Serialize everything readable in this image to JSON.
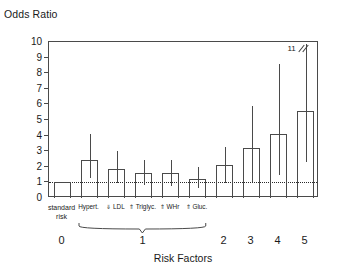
{
  "chart_data": {
    "type": "bar",
    "title": "",
    "ylabel": "Odds Ratio",
    "xlabel": "Risk Factors",
    "ylim": [
      0,
      10
    ],
    "yticks": [
      0,
      1,
      2,
      3,
      4,
      5,
      6,
      7,
      8,
      9,
      10
    ],
    "grid": false,
    "legend": null,
    "reference_line": {
      "value": 1,
      "style": "dotted"
    },
    "group_labels": [
      "0",
      "1",
      "2",
      "3",
      "4",
      "5"
    ],
    "categories": [
      "standard risk",
      "Hypert.",
      "⇓ LDL",
      "⇑ Triglyc.",
      "⇑ WHr",
      "⇑ Gluc.",
      "2",
      "3",
      "4",
      "5"
    ],
    "values": [
      1.0,
      2.45,
      1.85,
      1.6,
      1.6,
      1.25,
      2.1,
      3.2,
      4.1,
      5.6
    ],
    "ci_low": [
      null,
      1.25,
      0.95,
      0.85,
      0.8,
      0.65,
      0.95,
      1.0,
      1.45,
      2.3
    ],
    "ci_high": [
      null,
      4.1,
      3.0,
      2.45,
      2.45,
      2.0,
      3.3,
      5.9,
      8.6,
      11.0
    ],
    "annotations": [
      {
        "text": "11",
        "meaning": "axis-break-upper-ci",
        "series_index": 9
      }
    ]
  },
  "axis": {
    "y_title": "Odds Ratio",
    "x_title": "Risk Factors",
    "y_ticks": [
      "0",
      "1",
      "2",
      "3",
      "4",
      "5",
      "6",
      "7",
      "8",
      "9",
      "10"
    ],
    "x_group_ticks": [
      "0",
      "1",
      "2",
      "3",
      "4",
      "5"
    ]
  },
  "bars": [
    {
      "label_line1": "standard",
      "label_line2": "risk",
      "value": 1.0,
      "low": null,
      "high": null
    },
    {
      "label_line1": "Hypert.",
      "label_line2": "",
      "value": 2.45,
      "low": 1.25,
      "high": 4.1
    },
    {
      "label_line1": "⇓ LDL",
      "label_line2": "",
      "value": 1.85,
      "low": 0.95,
      "high": 3.0
    },
    {
      "label_line1": "⇑ Triglyc.",
      "label_line2": "",
      "value": 1.6,
      "low": 0.85,
      "high": 2.45
    },
    {
      "label_line1": "⇑ WHr",
      "label_line2": "",
      "value": 1.6,
      "low": 0.8,
      "high": 2.45
    },
    {
      "label_line1": "⇑ Gluc.",
      "label_line2": "",
      "value": 1.25,
      "low": 0.65,
      "high": 2.0
    },
    {
      "label_line1": "",
      "label_line2": "",
      "value": 2.1,
      "low": 0.95,
      "high": 3.3
    },
    {
      "label_line1": "",
      "label_line2": "",
      "value": 3.2,
      "low": 1.0,
      "high": 5.9
    },
    {
      "label_line1": "",
      "label_line2": "",
      "value": 4.1,
      "low": 1.45,
      "high": 8.6
    },
    {
      "label_line1": "",
      "label_line2": "",
      "value": 5.6,
      "low": 2.3,
      "high": 11.0
    }
  ],
  "break_annotation": {
    "text": "11"
  }
}
